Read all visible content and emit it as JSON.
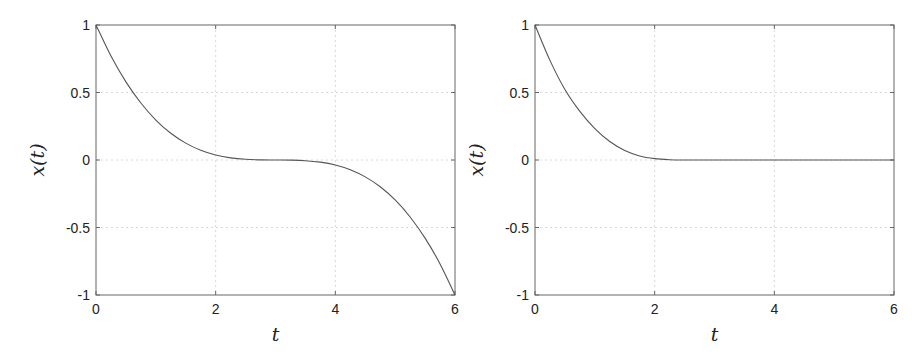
{
  "chart_data": [
    {
      "type": "line",
      "title": "",
      "xlabel": "t",
      "ylabel": "x(t)",
      "xlim": [
        0,
        6
      ],
      "ylim": [
        -1,
        1
      ],
      "xticks": [
        "0",
        "2",
        "4",
        "6"
      ],
      "yticks": [
        "1",
        "0.5",
        "0",
        "-0.5",
        "-1"
      ],
      "grid": true,
      "legend": null,
      "series": [
        {
          "name": "x(t)",
          "color": "#555555",
          "x": [
            0,
            0.25,
            0.5,
            0.75,
            1.0,
            1.25,
            1.5,
            1.75,
            2.0,
            2.25,
            2.5,
            2.75,
            3.0,
            3.25,
            3.5,
            3.75,
            4.0,
            4.25,
            4.5,
            4.75,
            5.0,
            5.25,
            5.5,
            5.75,
            6.0
          ],
          "y": [
            1.0,
            0.77,
            0.579,
            0.422,
            0.296,
            0.198,
            0.125,
            0.072,
            0.037,
            0.016,
            0.005,
            0.001,
            0.0,
            -0.001,
            -0.005,
            -0.016,
            -0.037,
            -0.072,
            -0.125,
            -0.198,
            -0.296,
            -0.422,
            -0.579,
            -0.77,
            -1.0
          ]
        }
      ]
    },
    {
      "type": "line",
      "title": "",
      "xlabel": "t",
      "ylabel": "x(t)",
      "xlim": [
        0,
        6
      ],
      "ylim": [
        -1,
        1
      ],
      "xticks": [
        "0",
        "2",
        "4",
        "6"
      ],
      "yticks": [
        "1",
        "0.5",
        "0",
        "-0.5",
        "-1"
      ],
      "grid": true,
      "legend": null,
      "series": [
        {
          "name": "x(t)",
          "color": "#555555",
          "x": [
            0,
            0.25,
            0.5,
            0.75,
            1.0,
            1.25,
            1.5,
            1.75,
            2.0,
            2.25,
            2.5,
            2.6,
            3.0,
            3.5,
            4.0,
            4.5,
            5.0,
            5.5,
            6.0
          ],
          "y": [
            1.0,
            0.738,
            0.522,
            0.36,
            0.233,
            0.137,
            0.07,
            0.03,
            0.01,
            0.002,
            0.0,
            0.0,
            0.0,
            0.0,
            0.0,
            0.0,
            0.0,
            0.0,
            0.0
          ]
        }
      ]
    }
  ],
  "panels": [
    {
      "ylabel": "x(t)",
      "xlabel": "t"
    },
    {
      "ylabel": "x(t)",
      "xlabel": "t"
    }
  ]
}
